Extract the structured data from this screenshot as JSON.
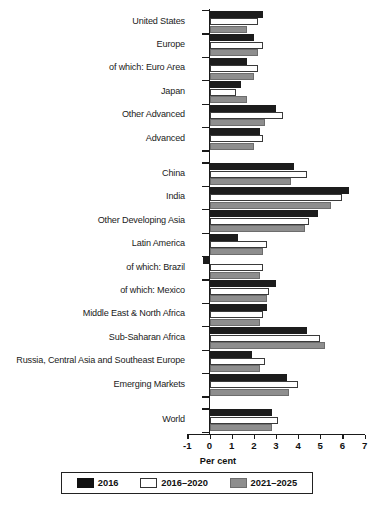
{
  "chart_data": {
    "type": "bar",
    "orientation": "horizontal",
    "title": "",
    "xlabel": "Per cent",
    "ylabel": "",
    "xlim": [
      -1,
      7
    ],
    "xticks": [
      -1,
      0,
      1,
      2,
      3,
      4,
      5,
      6,
      7
    ],
    "xticklabels": [
      "-1",
      "0",
      "1",
      "2",
      "3",
      "4",
      "5",
      "6",
      "7"
    ],
    "grid": false,
    "legend_position": "bottom",
    "legend": [
      "2016",
      "2016–2020",
      "2021–2025"
    ],
    "colors": {
      "2016": "#111111",
      "2016-2020": "#ffffff",
      "2021-2025": "#8e8e8e"
    },
    "categories": [
      "United States",
      "Europe",
      "of which: Euro Area",
      "Japan",
      "Other Advanced",
      "Advanced",
      "China",
      "India",
      "Other Developing Asia",
      "Latin America",
      "of which: Brazil",
      "of which: Mexico",
      "Middle East & North Africa",
      "Sub-Saharan Africa",
      "Russia, Central Asia and Southeast Europe",
      "Emerging Markets",
      "World"
    ],
    "series": [
      {
        "name": "2016",
        "values": [
          2.4,
          2.0,
          1.7,
          1.4,
          3.0,
          2.3,
          3.8,
          6.3,
          4.9,
          1.3,
          -0.3,
          3.0,
          2.6,
          4.4,
          1.9,
          3.5,
          2.8
        ]
      },
      {
        "name": "2016–2020",
        "values": [
          2.2,
          2.4,
          2.2,
          1.2,
          3.3,
          2.4,
          4.4,
          6.0,
          4.5,
          2.6,
          2.4,
          2.7,
          2.4,
          5.0,
          2.5,
          4.0,
          3.1
        ]
      },
      {
        "name": "2021–2025",
        "values": [
          1.7,
          2.2,
          2.0,
          1.7,
          2.5,
          2.0,
          3.7,
          5.5,
          4.3,
          2.4,
          2.3,
          2.6,
          2.3,
          5.2,
          2.3,
          3.6,
          2.8
        ]
      }
    ],
    "group_gaps_after": [
      "Advanced",
      "Emerging Markets"
    ]
  },
  "axis": {
    "units_label": "Per cent"
  }
}
